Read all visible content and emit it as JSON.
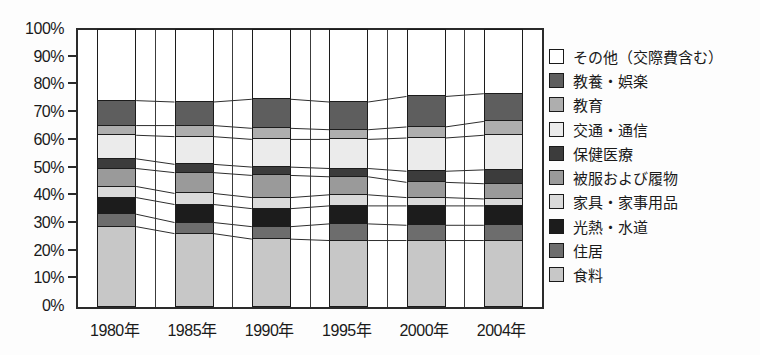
{
  "chart_data": {
    "type": "bar",
    "subtype": "stacked-100-percent-column",
    "title": "",
    "xlabel": "",
    "ylabel": "",
    "unit": "%",
    "ylim": [
      0,
      100
    ],
    "grid": "vertical-category-separators",
    "legend_position": "right",
    "categories": [
      "1980年",
      "1985年",
      "1990年",
      "1995年",
      "2000年",
      "2004年"
    ],
    "y_ticks": [
      "100%",
      "90%",
      "80%",
      "70%",
      "60%",
      "50%",
      "40%",
      "30%",
      "20%",
      "10%",
      "0%"
    ],
    "stacking_order_note": "series listed bottom-to-top of each column; legend shown top-to-bottom in reverse order",
    "series": [
      {
        "name": "食料",
        "color": "#c7c7c7",
        "values": [
          29,
          26.5,
          24.5,
          24,
          24,
          24
        ]
      },
      {
        "name": "住居",
        "color": "#6d6d6d",
        "values": [
          4.5,
          4,
          4.5,
          6,
          5.5,
          5.5
        ]
      },
      {
        "name": "光熱・水道",
        "color": "#1c1c1c",
        "values": [
          6,
          6.5,
          6.5,
          6.5,
          7,
          7
        ]
      },
      {
        "name": "家具・家事用品",
        "color": "#dadada",
        "values": [
          4,
          4,
          4,
          4,
          3,
          2.5
        ]
      },
      {
        "name": "被服および履物",
        "color": "#9a9a9a",
        "values": [
          6.5,
          7.5,
          8,
          6.5,
          5.5,
          5.5
        ]
      },
      {
        "name": "保健医療",
        "color": "#3c3c3c",
        "values": [
          3.5,
          3,
          3,
          3,
          4,
          5
        ]
      },
      {
        "name": "交通・通信",
        "color": "#ebebeb",
        "values": [
          8.5,
          10,
          10,
          10.5,
          12,
          12.5
        ]
      },
      {
        "name": "教育",
        "color": "#aeaeae",
        "values": [
          3.5,
          4,
          4,
          3.5,
          4,
          5
        ]
      },
      {
        "name": "教養・娯楽",
        "color": "#5e5e5e",
        "values": [
          9,
          8.5,
          10.5,
          10,
          11,
          10
        ]
      },
      {
        "name": "その他（交際費含む）",
        "color": "#ffffff",
        "values": [
          25.5,
          26,
          25,
          26,
          24,
          23
        ]
      }
    ],
    "legend_order_top_to_bottom": [
      "その他（交際費含む）",
      "教養・娯楽",
      "教育",
      "交通・通信",
      "保健医療",
      "被服および履物",
      "家具・家事用品",
      "光熱・水道",
      "住居",
      "食料"
    ]
  },
  "colors": {
    "axis": "#2b2b2b",
    "segment_border": "#1c1c1c",
    "connector_line": "#2e2e2e",
    "background": "#fdfdfd"
  }
}
